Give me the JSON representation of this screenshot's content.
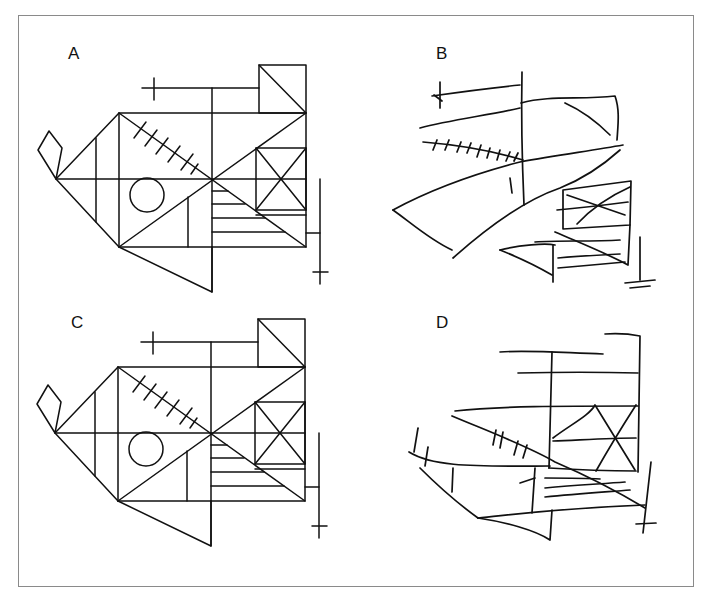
{
  "figure": {
    "panels": [
      {
        "id": "A",
        "label": "A",
        "description": "Rey-Osterrieth complex figure (model)"
      },
      {
        "id": "B",
        "label": "B",
        "description": "Hand-drawn copy of figure"
      },
      {
        "id": "C",
        "label": "C",
        "description": "Rey-Osterrieth complex figure (model)"
      },
      {
        "id": "D",
        "label": "D",
        "description": "Hand-drawn copy of figure"
      }
    ]
  },
  "colors": {
    "ink": "#111111",
    "frame": "#8a8a8a",
    "background": "#ffffff"
  }
}
